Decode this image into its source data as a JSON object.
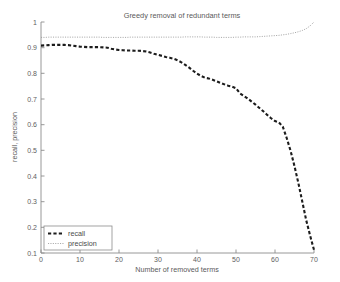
{
  "chart_data": {
    "type": "line",
    "title": "Greedy removal of redundant terms",
    "xlabel": "Number of removed terms",
    "ylabel": "recall, precision",
    "xlim": [
      0,
      70
    ],
    "ylim": [
      0.1,
      1
    ],
    "grid": false,
    "legend_position": "lower left",
    "xticks": [
      0,
      10,
      20,
      30,
      40,
      50,
      60,
      70
    ],
    "xtick_labels": [
      "0",
      "10",
      "20",
      "30",
      "40",
      "50",
      "60",
      "70"
    ],
    "yticks": [
      0.1,
      0.2,
      0.3,
      0.4,
      0.5,
      0.6,
      0.7,
      0.8,
      0.9,
      1
    ],
    "ytick_labels": [
      "0.1",
      "0.2",
      "0.3",
      "0.4",
      "0.5",
      "0.6",
      "0.7",
      "0.8",
      "0.9",
      "1"
    ],
    "x": [
      0,
      1,
      2,
      3,
      4,
      5,
      6,
      7,
      8,
      9,
      10,
      11,
      12,
      13,
      14,
      15,
      16,
      17,
      18,
      19,
      20,
      21,
      22,
      23,
      24,
      25,
      26,
      27,
      28,
      29,
      30,
      31,
      32,
      33,
      34,
      35,
      36,
      37,
      38,
      39,
      40,
      41,
      42,
      43,
      44,
      45,
      46,
      47,
      48,
      49,
      50,
      51,
      52,
      53,
      54,
      55,
      56,
      57,
      58,
      59,
      60,
      61,
      62,
      63,
      64,
      65,
      66,
      67,
      68,
      69,
      70
    ],
    "series": [
      {
        "name": "recall",
        "style": "dashed",
        "color": "#1c1c1c",
        "values": [
          0.908,
          0.909,
          0.91,
          0.911,
          0.911,
          0.911,
          0.911,
          0.91,
          0.908,
          0.906,
          0.904,
          0.903,
          0.902,
          0.902,
          0.902,
          0.902,
          0.901,
          0.9,
          0.896,
          0.893,
          0.891,
          0.89,
          0.889,
          0.889,
          0.888,
          0.888,
          0.887,
          0.885,
          0.881,
          0.876,
          0.872,
          0.868,
          0.864,
          0.861,
          0.857,
          0.851,
          0.843,
          0.833,
          0.822,
          0.81,
          0.799,
          0.79,
          0.783,
          0.78,
          0.775,
          0.769,
          0.763,
          0.757,
          0.752,
          0.748,
          0.742,
          0.722,
          0.712,
          0.702,
          0.69,
          0.678,
          0.665,
          0.652,
          0.638,
          0.625,
          0.614,
          0.609,
          0.592,
          0.548,
          0.498,
          0.438,
          0.372,
          0.3,
          0.228,
          0.168,
          0.112
        ]
      },
      {
        "name": "precision",
        "style": "dotted",
        "color": "#9a9a9a",
        "values": [
          0.94,
          0.94,
          0.941,
          0.941,
          0.941,
          0.941,
          0.941,
          0.941,
          0.941,
          0.941,
          0.941,
          0.941,
          0.941,
          0.941,
          0.941,
          0.941,
          0.94,
          0.94,
          0.94,
          0.94,
          0.94,
          0.94,
          0.94,
          0.941,
          0.941,
          0.941,
          0.941,
          0.941,
          0.941,
          0.941,
          0.941,
          0.941,
          0.941,
          0.941,
          0.941,
          0.941,
          0.941,
          0.942,
          0.942,
          0.942,
          0.942,
          0.942,
          0.941,
          0.941,
          0.941,
          0.94,
          0.94,
          0.94,
          0.94,
          0.94,
          0.941,
          0.941,
          0.942,
          0.942,
          0.942,
          0.942,
          0.943,
          0.944,
          0.945,
          0.946,
          0.947,
          0.948,
          0.95,
          0.952,
          0.955,
          0.958,
          0.962,
          0.967,
          0.974,
          0.985,
          1.0
        ]
      }
    ],
    "legend": [
      {
        "label": "recall"
      },
      {
        "label": "precision"
      }
    ]
  }
}
